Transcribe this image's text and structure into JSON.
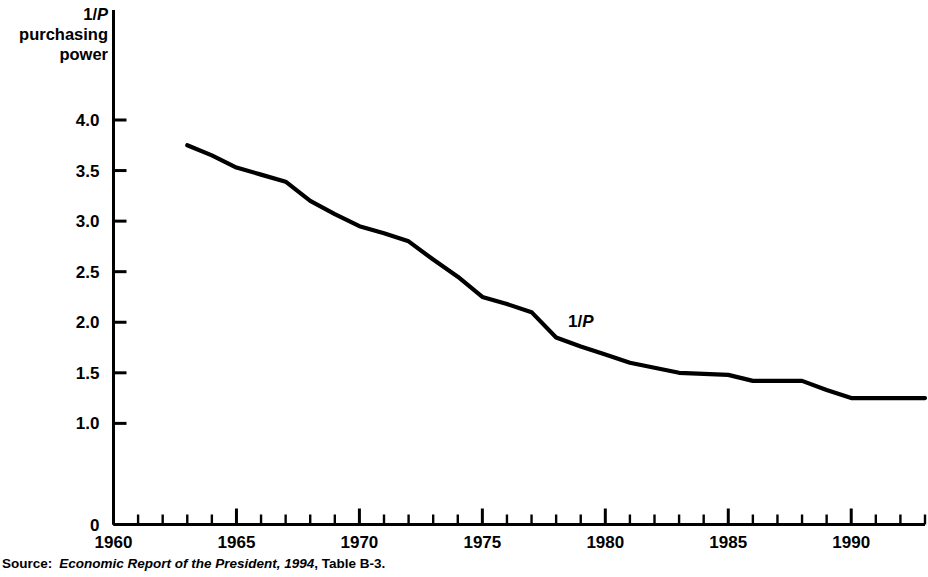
{
  "figure": {
    "y_axis_title_lines": [
      "1/P",
      "purchasing",
      "power"
    ],
    "y_axis_title_plain": "1/P purchasing power",
    "series_annotation": "1/P",
    "source_label": "Source:",
    "source_title": "Economic Report of the President, 1994",
    "source_tail": "Table B-3.",
    "line_color": "#000000",
    "background_color": "#ffffff",
    "axis_color": "#000000"
  },
  "chart_data": {
    "type": "line",
    "title": "",
    "xlabel": "",
    "ylabel": "1/P purchasing power",
    "xlim": [
      1960,
      1993
    ],
    "ylim": [
      0,
      4.25
    ],
    "grid": false,
    "legend": "inline-annotation",
    "y_ticks": [
      "4.0",
      "3.5",
      "3.0",
      "2.5",
      "2.0",
      "1.5",
      "1.0",
      "0"
    ],
    "y_tick_values": [
      4.0,
      3.5,
      3.0,
      2.5,
      2.0,
      1.5,
      1.0,
      0
    ],
    "x_ticks": [
      "1960",
      "1965",
      "1970",
      "1975",
      "1980",
      "1985",
      "1990"
    ],
    "x_tick_values": [
      1960,
      1965,
      1970,
      1975,
      1980,
      1985,
      1990
    ],
    "x_minor_tick_interval": 1,
    "series": [
      {
        "name": "1/P",
        "x": [
          1963,
          1964,
          1965,
          1966,
          1967,
          1968,
          1969,
          1970,
          1971,
          1972,
          1973,
          1974,
          1975,
          1976,
          1977,
          1978,
          1979,
          1980,
          1981,
          1982,
          1983,
          1984,
          1985,
          1986,
          1987,
          1988,
          1989,
          1990,
          1991,
          1992,
          1993
        ],
        "values": [
          3.75,
          3.65,
          3.53,
          3.46,
          3.39,
          3.2,
          3.07,
          2.95,
          2.88,
          2.8,
          2.62,
          2.45,
          2.25,
          2.18,
          2.1,
          1.85,
          1.76,
          1.68,
          1.6,
          1.55,
          1.5,
          1.49,
          1.48,
          1.42,
          1.42,
          1.42,
          1.33,
          1.25,
          1.25,
          1.25,
          1.25
        ]
      }
    ]
  }
}
